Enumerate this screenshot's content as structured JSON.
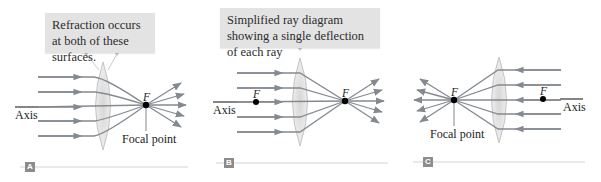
{
  "figure": {
    "panels": [
      {
        "id": "A",
        "badge": "A",
        "callout": "Refraction occurs at both of these surfaces.",
        "axis_label": "Axis",
        "focal_label": "F",
        "focal_point_label": "Focal point",
        "ray_direction": "left-to-right"
      },
      {
        "id": "B",
        "badge": "B",
        "callout": "Simplified ray diagram showing a single deflection of each ray",
        "axis_label": "Axis",
        "near_focal_label": "F",
        "focal_label": "F",
        "ray_direction": "left-to-right"
      },
      {
        "id": "C",
        "badge": "C",
        "axis_label": "Axis",
        "near_focal_label": "F",
        "focal_label": "F",
        "focal_point_label": "Focal point",
        "ray_direction": "right-to-left"
      }
    ]
  },
  "colors": {
    "ray": "#858a91",
    "lens_edge": "#c4c4c4",
    "lens_fill": "#e6e6e6",
    "callout_bg": "#e3e3e3",
    "badge_bg": "#8c8c8c",
    "rule": "#d4d4d4",
    "text": "#222222"
  }
}
